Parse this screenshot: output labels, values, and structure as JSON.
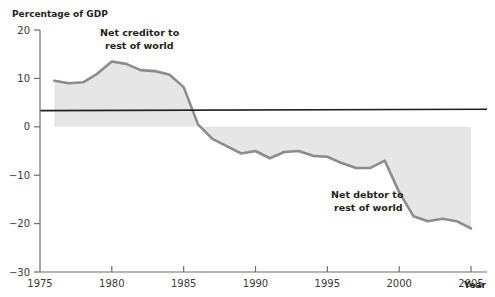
{
  "chart_data": {
    "type": "area",
    "title": "",
    "ylabel": "Percentage of GDP",
    "xlabel": "Year",
    "ylim": [
      -30,
      20
    ],
    "xlim": [
      1975,
      2005
    ],
    "grid": false,
    "legend": "none",
    "y_ticks": [
      20,
      10,
      0,
      -10,
      -20,
      -30
    ],
    "y_tick_labels": [
      "20",
      "10",
      "0",
      "−10",
      "−20",
      "−30"
    ],
    "x_ticks": [
      1975,
      1980,
      1985,
      1990,
      1995,
      2000,
      2005
    ],
    "x_tick_labels": [
      "1975",
      "1980",
      "1985",
      "1990",
      "1995",
      "2000",
      "2005"
    ],
    "series": [
      {
        "name": "Net international investment position",
        "x": [
          1976,
          1977,
          1978,
          1979,
          1980,
          1981,
          1982,
          1983,
          1984,
          1985,
          1986,
          1987,
          1988,
          1989,
          1990,
          1991,
          1992,
          1993,
          1994,
          1995,
          1996,
          1997,
          1998,
          1999,
          2000,
          2001,
          2002,
          2003,
          2004,
          2005
        ],
        "values": [
          9.5,
          9.0,
          9.2,
          11.0,
          13.5,
          13.0,
          11.7,
          11.5,
          10.8,
          8.2,
          0.5,
          -2.5,
          -4.0,
          -5.5,
          -5.0,
          -6.5,
          -5.2,
          -5.0,
          -6.0,
          -6.2,
          -7.5,
          -8.5,
          -8.5,
          -7.0,
          -13.5,
          -18.5,
          -19.5,
          -19.0,
          -19.5,
          -21.0
        ]
      }
    ],
    "annotations": [
      {
        "id": "net-creditor",
        "line1": "Net creditor to",
        "line2": "rest of world"
      },
      {
        "id": "net-debtor",
        "line1": "Net debtor to",
        "line2": "rest of world"
      }
    ],
    "colors": {
      "line": "#8c8c8c",
      "fill": "#e6e6e6",
      "axis": "#6f6f6f",
      "zero_line": "#231f20",
      "text": "#231f20"
    }
  }
}
